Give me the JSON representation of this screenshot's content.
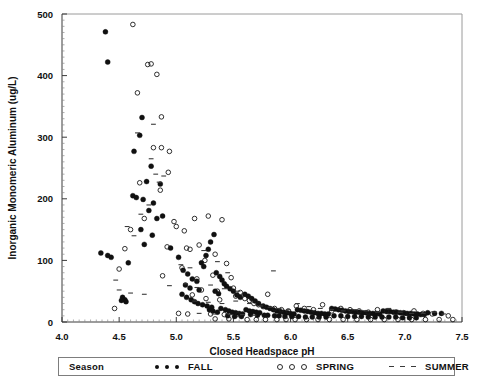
{
  "chart_data": {
    "type": "scatter",
    "title": "",
    "xlabel": "Closed  Headspace  pH",
    "ylabel": "Inorganic Monomeric Aluminum (ug/L)",
    "xlim": [
      4.0,
      7.5
    ],
    "ylim": [
      0,
      500
    ],
    "xticks": [
      "4.0",
      "4.5",
      "5.0",
      "5.5",
      "6.0",
      "6.5",
      "7.0",
      "7.5"
    ],
    "xtick_values": [
      4.0,
      4.5,
      5.0,
      5.5,
      6.0,
      6.5,
      7.0,
      7.5
    ],
    "yticks": [
      "0",
      "100",
      "200",
      "300",
      "400",
      "500"
    ],
    "ytick_values": [
      0,
      100,
      200,
      300,
      400,
      500
    ],
    "grid": false,
    "legend_position": "bottom",
    "legend_title": "Season",
    "series": [
      {
        "name": "FALL",
        "marker": "filled-circle",
        "color": "#101010",
        "points": [
          [
            4.38,
            471
          ],
          [
            4.4,
            422
          ],
          [
            4.7,
            332
          ],
          [
            4.68,
            303
          ],
          [
            4.63,
            277
          ],
          [
            4.78,
            253
          ],
          [
            4.74,
            228
          ],
          [
            4.86,
            224
          ],
          [
            4.62,
            205
          ],
          [
            4.65,
            202
          ],
          [
            4.71,
            199
          ],
          [
            4.8,
            193
          ],
          [
            4.76,
            181
          ],
          [
            4.88,
            172
          ],
          [
            4.83,
            168
          ],
          [
            4.34,
            112
          ],
          [
            4.4,
            108
          ],
          [
            4.43,
            105
          ],
          [
            4.69,
            150
          ],
          [
            4.79,
            141
          ],
          [
            4.72,
            126
          ],
          [
            4.95,
            120
          ],
          [
            4.58,
            96
          ],
          [
            4.53,
            40
          ],
          [
            4.55,
            36
          ],
          [
            4.56,
            33
          ],
          [
            4.52,
            35
          ],
          [
            5.02,
            105
          ],
          [
            5.06,
            84
          ],
          [
            5.1,
            78
          ],
          [
            5.14,
            70
          ],
          [
            5.18,
            66
          ],
          [
            5.08,
            60
          ],
          [
            5.12,
            55
          ],
          [
            5.2,
            52
          ],
          [
            5.24,
            90
          ],
          [
            5.28,
            118
          ],
          [
            5.3,
            130
          ],
          [
            5.33,
            142
          ],
          [
            5.26,
            108
          ],
          [
            5.22,
            96
          ],
          [
            5.35,
            80
          ],
          [
            5.38,
            74
          ],
          [
            5.4,
            68
          ],
          [
            5.42,
            62
          ],
          [
            5.05,
            45
          ],
          [
            5.09,
            40
          ],
          [
            5.13,
            36
          ],
          [
            5.16,
            33
          ],
          [
            5.19,
            30
          ],
          [
            5.23,
            28
          ],
          [
            5.27,
            26
          ],
          [
            5.31,
            24
          ],
          [
            5.34,
            50
          ],
          [
            5.37,
            46
          ],
          [
            5.44,
            58
          ],
          [
            5.47,
            54
          ],
          [
            5.5,
            50
          ],
          [
            5.53,
            44
          ],
          [
            5.56,
            40
          ],
          [
            5.29,
            20
          ],
          [
            5.32,
            18
          ],
          [
            5.36,
            16
          ],
          [
            5.39,
            22
          ],
          [
            5.43,
            20
          ],
          [
            5.46,
            18
          ],
          [
            5.49,
            16
          ],
          [
            5.52,
            15
          ],
          [
            5.55,
            14
          ],
          [
            5.58,
            13
          ],
          [
            5.6,
            45
          ],
          [
            5.63,
            42
          ],
          [
            5.66,
            38
          ],
          [
            5.69,
            34
          ],
          [
            5.72,
            30
          ],
          [
            5.61,
            20
          ],
          [
            5.64,
            18
          ],
          [
            5.67,
            17
          ],
          [
            5.7,
            16
          ],
          [
            5.73,
            15
          ],
          [
            5.76,
            26
          ],
          [
            5.79,
            24
          ],
          [
            5.82,
            22
          ],
          [
            5.85,
            20
          ],
          [
            5.88,
            18
          ],
          [
            5.91,
            17
          ],
          [
            5.94,
            16
          ],
          [
            5.97,
            15
          ],
          [
            6.0,
            14
          ],
          [
            6.03,
            13
          ],
          [
            6.06,
            20
          ],
          [
            6.09,
            19
          ],
          [
            6.12,
            18
          ],
          [
            6.15,
            17
          ],
          [
            6.18,
            16
          ],
          [
            6.21,
            15
          ],
          [
            6.24,
            14
          ],
          [
            6.27,
            14
          ],
          [
            6.3,
            13
          ],
          [
            6.33,
            13
          ],
          [
            6.36,
            22
          ],
          [
            6.39,
            21
          ],
          [
            6.42,
            20
          ],
          [
            6.45,
            19
          ],
          [
            6.48,
            18
          ],
          [
            6.51,
            17
          ],
          [
            6.54,
            17
          ],
          [
            6.57,
            16
          ],
          [
            6.6,
            16
          ],
          [
            6.63,
            15
          ],
          [
            6.66,
            15
          ],
          [
            6.69,
            14
          ],
          [
            6.72,
            14
          ],
          [
            6.75,
            14
          ],
          [
            6.78,
            13
          ],
          [
            6.81,
            18
          ],
          [
            6.84,
            17
          ],
          [
            6.87,
            17
          ],
          [
            6.9,
            16
          ],
          [
            6.93,
            16
          ],
          [
            6.96,
            15
          ],
          [
            6.99,
            15
          ],
          [
            7.02,
            14
          ],
          [
            7.05,
            14
          ],
          [
            7.08,
            13
          ],
          [
            7.11,
            13
          ],
          [
            7.14,
            12
          ],
          [
            7.17,
            12
          ],
          [
            7.2,
            15
          ],
          [
            7.26,
            14
          ],
          [
            7.32,
            14
          ],
          [
            6.38,
            10
          ],
          [
            6.44,
            10
          ],
          [
            6.5,
            9
          ],
          [
            6.56,
            9
          ],
          [
            6.62,
            9
          ],
          [
            6.68,
            8
          ],
          [
            6.74,
            8
          ],
          [
            6.8,
            8
          ],
          [
            6.86,
            8
          ],
          [
            6.92,
            8
          ],
          [
            6.98,
            7
          ],
          [
            7.04,
            7
          ],
          [
            7.1,
            7
          ],
          [
            5.95,
            9
          ],
          [
            6.01,
            9
          ],
          [
            6.07,
            9
          ],
          [
            6.13,
            8
          ],
          [
            6.19,
            8
          ],
          [
            6.25,
            8
          ],
          [
            6.31,
            8
          ],
          [
            5.8,
            11
          ],
          [
            5.86,
            10
          ],
          [
            5.9,
            10
          ],
          [
            5.45,
            10
          ],
          [
            5.51,
            9
          ],
          [
            5.57,
            9
          ],
          [
            5.65,
            12
          ],
          [
            5.71,
            11
          ],
          [
            5.77,
            11
          ]
        ]
      },
      {
        "name": "SPRING",
        "marker": "open-circle",
        "color": "#1a1a1a",
        "points": [
          [
            4.62,
            483
          ],
          [
            4.75,
            418
          ],
          [
            4.78,
            419
          ],
          [
            4.83,
            402
          ],
          [
            4.66,
            372
          ],
          [
            4.87,
            333
          ],
          [
            4.87,
            283
          ],
          [
            4.94,
            277
          ],
          [
            4.8,
            283
          ],
          [
            4.93,
            243
          ],
          [
            4.68,
            226
          ],
          [
            4.86,
            214
          ],
          [
            4.72,
            168
          ],
          [
            4.98,
            163
          ],
          [
            4.6,
            150
          ],
          [
            4.55,
            119
          ],
          [
            4.5,
            86
          ],
          [
            4.46,
            22
          ],
          [
            4.92,
            122
          ],
          [
            4.88,
            75
          ],
          [
            5.0,
            155
          ],
          [
            5.07,
            148
          ],
          [
            5.16,
            168
          ],
          [
            5.28,
            172
          ],
          [
            5.4,
            166
          ],
          [
            5.2,
            125
          ],
          [
            5.09,
            120
          ],
          [
            5.12,
            118
          ],
          [
            5.34,
            110
          ],
          [
            5.25,
            100
          ],
          [
            5.44,
            95
          ],
          [
            5.05,
            88
          ],
          [
            5.18,
            70
          ],
          [
            5.32,
            76
          ],
          [
            5.48,
            72
          ],
          [
            5.22,
            52
          ],
          [
            5.36,
            50
          ],
          [
            5.5,
            55
          ],
          [
            5.56,
            48
          ],
          [
            5.14,
            44
          ],
          [
            5.26,
            38
          ],
          [
            5.38,
            36
          ],
          [
            5.52,
            42
          ],
          [
            5.6,
            38
          ],
          [
            5.64,
            35
          ],
          [
            5.02,
            14
          ],
          [
            5.1,
            13
          ],
          [
            5.3,
            13
          ],
          [
            5.42,
            12
          ],
          [
            5.54,
            12
          ],
          [
            5.68,
            30
          ],
          [
            5.72,
            28
          ],
          [
            5.76,
            25
          ],
          [
            5.8,
            45
          ],
          [
            5.86,
            22
          ],
          [
            5.92,
            20
          ],
          [
            5.98,
            18
          ],
          [
            6.05,
            26
          ],
          [
            6.12,
            22
          ],
          [
            6.2,
            20
          ],
          [
            6.28,
            28
          ],
          [
            6.36,
            18
          ],
          [
            6.44,
            22
          ],
          [
            6.52,
            20
          ],
          [
            6.6,
            18
          ],
          [
            6.68,
            16
          ],
          [
            6.76,
            20
          ],
          [
            6.84,
            18
          ],
          [
            6.92,
            16
          ],
          [
            7.0,
            14
          ],
          [
            7.08,
            18
          ],
          [
            7.16,
            14
          ],
          [
            7.24,
            13
          ],
          [
            7.38,
            10
          ],
          [
            5.62,
            4
          ],
          [
            5.7,
            4
          ],
          [
            5.78,
            4
          ],
          [
            5.88,
            4
          ],
          [
            5.96,
            4
          ],
          [
            6.04,
            4
          ],
          [
            6.14,
            4
          ],
          [
            6.24,
            4
          ],
          [
            6.34,
            4
          ],
          [
            6.46,
            4
          ],
          [
            6.58,
            4
          ],
          [
            6.7,
            4
          ],
          [
            6.82,
            4
          ],
          [
            6.94,
            4
          ],
          [
            7.06,
            4
          ],
          [
            7.18,
            4
          ],
          [
            7.3,
            4
          ],
          [
            7.42,
            4
          ],
          [
            5.46,
            5
          ],
          [
            5.34,
            5
          ]
        ]
      },
      {
        "name": "SUMMER",
        "marker": "dash",
        "color": "#3a3a3a",
        "points": [
          [
            4.66,
            307
          ],
          [
            4.8,
            321
          ],
          [
            4.78,
            265
          ],
          [
            4.82,
            240
          ],
          [
            4.85,
            227
          ],
          [
            4.76,
            190
          ],
          [
            4.69,
            175
          ],
          [
            4.57,
            155
          ],
          [
            4.63,
            140
          ],
          [
            4.89,
            237
          ],
          [
            4.47,
            68
          ],
          [
            4.5,
            52
          ],
          [
            4.6,
            47
          ],
          [
            4.94,
            59
          ],
          [
            4.72,
            45
          ],
          [
            5.04,
            93
          ],
          [
            5.12,
            88
          ],
          [
            5.24,
            116
          ],
          [
            5.36,
            98
          ],
          [
            5.45,
            80
          ],
          [
            5.08,
            62
          ],
          [
            5.18,
            56
          ],
          [
            5.3,
            60
          ],
          [
            5.42,
            54
          ],
          [
            5.54,
            50
          ],
          [
            5.16,
            34
          ],
          [
            5.28,
            32
          ],
          [
            5.4,
            30
          ],
          [
            5.52,
            34
          ],
          [
            5.64,
            30
          ],
          [
            5.85,
            83
          ],
          [
            5.74,
            26
          ],
          [
            5.82,
            24
          ],
          [
            5.9,
            22
          ],
          [
            5.98,
            20
          ],
          [
            6.06,
            30
          ],
          [
            6.16,
            25
          ],
          [
            6.26,
            22
          ],
          [
            6.36,
            20
          ],
          [
            6.46,
            18
          ],
          [
            6.56,
            20
          ],
          [
            6.66,
            18
          ],
          [
            6.76,
            16
          ],
          [
            6.86,
            22
          ],
          [
            6.96,
            16
          ],
          [
            7.06,
            14
          ],
          [
            7.16,
            14
          ],
          [
            7.26,
            16
          ],
          [
            7.34,
            13
          ],
          [
            5.2,
            14
          ],
          [
            5.33,
            13
          ],
          [
            5.47,
            12
          ],
          [
            5.58,
            12
          ],
          [
            5.68,
            11
          ]
        ]
      }
    ]
  },
  "legend": {
    "title": "Season",
    "entries": [
      {
        "label": "FALL",
        "marker": "filled-circle"
      },
      {
        "label": "SPRING",
        "marker": "open-circle"
      },
      {
        "label": "SUMMER",
        "marker": "dash"
      }
    ]
  }
}
